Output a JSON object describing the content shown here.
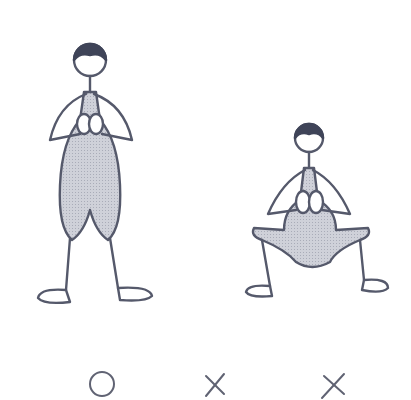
{
  "figures": [
    {
      "id": "standing",
      "label": "Standing posture, hands clasped at chest",
      "mark": "circle"
    },
    {
      "id": "squat-1",
      "label": "Wide squat posture",
      "mark": "cross"
    },
    {
      "id": "squat-2",
      "label": "Wide squat posture",
      "mark": "cross"
    }
  ],
  "marks": [
    "○",
    "×",
    "×"
  ],
  "colors": {
    "ink": "#55596b",
    "hair": "#3f4458",
    "fill": "#c2c4ce",
    "background": "#ffffff"
  }
}
